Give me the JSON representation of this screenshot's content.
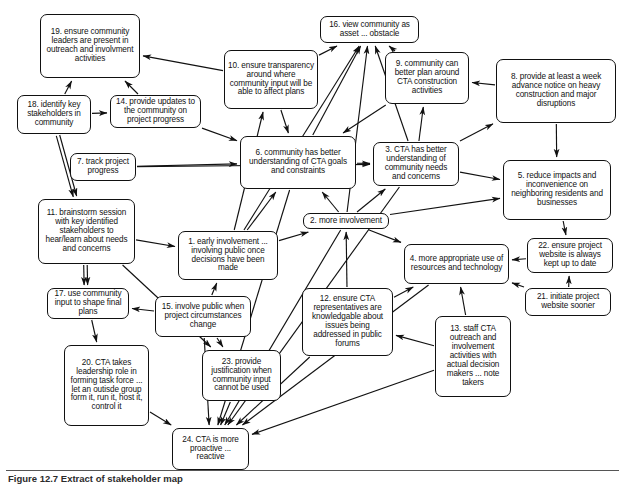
{
  "figure": {
    "caption": "Figure 12.7  Extract of stakeholder map",
    "type": "influence-diagram",
    "width": 625,
    "height": 483,
    "line_color": "#111111",
    "background_color": "#ffffff"
  },
  "nodes": [
    {
      "id": 19,
      "label": "19. ensure community leaders are present in outreach and involvment activities",
      "x": 40,
      "y": 14,
      "w": 100,
      "h": 64,
      "font": 8.2
    },
    {
      "id": 16,
      "label": "16. view community as asset ... obstacle",
      "x": 320,
      "y": 16,
      "w": 99,
      "h": 27,
      "font": 8.2
    },
    {
      "id": 10,
      "label": "10. ensure transparency around where community input will be able to affect plans",
      "x": 224,
      "y": 50,
      "w": 94,
      "h": 59,
      "font": 8.2
    },
    {
      "id": 9,
      "label": "9. community can better plan around CTA construction activities",
      "x": 385,
      "y": 52,
      "w": 84,
      "h": 52,
      "font": 8.2
    },
    {
      "id": 8,
      "label": "8. provide at least a week advance notice on heavy construction and major disruptions",
      "x": 496,
      "y": 59,
      "w": 120,
      "h": 64,
      "font": 8.2
    },
    {
      "id": 18,
      "label": "18. identify key stakeholders in community",
      "x": 17,
      "y": 95,
      "w": 74,
      "h": 39,
      "font": 8.2
    },
    {
      "id": 14,
      "label": "14. provide updates to the community on project progress",
      "x": 110,
      "y": 95,
      "w": 91,
      "h": 33,
      "font": 8.2
    },
    {
      "id": 6,
      "label": "6. community has better understanding of CTA goals and constraints",
      "x": 240,
      "y": 136,
      "w": 116,
      "h": 53,
      "font": 8.2
    },
    {
      "id": 3,
      "label": "3. CTA has better understanding of community needs and concerns",
      "x": 373,
      "y": 142,
      "w": 86,
      "h": 44,
      "font": 8.2
    },
    {
      "id": 7,
      "label": "7. track project progress",
      "x": 70,
      "y": 153,
      "w": 66,
      "h": 28,
      "font": 8.2
    },
    {
      "id": 5,
      "label": "5. reduce impacts and inconvenience on neighboring residents and businesses",
      "x": 503,
      "y": 160,
      "w": 108,
      "h": 60,
      "font": 8.2
    },
    {
      "id": 11,
      "label": "11. brainstorm session with key identified stakeholders to hear/learn about needs and concerns",
      "x": 38,
      "y": 199,
      "w": 97,
      "h": 65,
      "font": 8.2
    },
    {
      "id": 2,
      "label": "2. more involvement",
      "x": 303,
      "y": 213,
      "w": 86,
      "h": 16,
      "font": 8.2
    },
    {
      "id": 1,
      "label": "1. early involvement ... involving public once decisions have been made",
      "x": 178,
      "y": 231,
      "w": 100,
      "h": 49,
      "font": 8.2
    },
    {
      "id": 22,
      "label": "22. ensure project website is always kept up to date",
      "x": 527,
      "y": 238,
      "w": 86,
      "h": 35,
      "font": 8.2
    },
    {
      "id": 4,
      "label": "4. more appropriate use of resources and technology",
      "x": 404,
      "y": 244,
      "w": 105,
      "h": 40,
      "font": 8.2
    },
    {
      "id": 21,
      "label": "21. initiate project website sooner",
      "x": 525,
      "y": 288,
      "w": 86,
      "h": 28,
      "font": 8.2
    },
    {
      "id": 17,
      "label": "17. use community input to shape final plans",
      "x": 47,
      "y": 288,
      "w": 82,
      "h": 31,
      "font": 8.2
    },
    {
      "id": 12,
      "label": "12. ensure CTA representatives are knowledgable about issues being addressed in public forums",
      "x": 302,
      "y": 288,
      "w": 91,
      "h": 68,
      "font": 8.2
    },
    {
      "id": 15,
      "label": "15. involve public when project circumstances change",
      "x": 155,
      "y": 296,
      "w": 96,
      "h": 41,
      "font": 8.2
    },
    {
      "id": 13,
      "label": "13. staff CTA outreach and involvement activities with actual decision makers ... note takers",
      "x": 435,
      "y": 316,
      "w": 76,
      "h": 81,
      "font": 8.2
    },
    {
      "id": 20,
      "label": "20. CTA takes leadership role in forming task force ... let an outisde group form it, run it, host it, control it",
      "x": 64,
      "y": 345,
      "w": 85,
      "h": 81,
      "font": 8.2
    },
    {
      "id": 23,
      "label": "23. provide justification when community input cannot be used",
      "x": 202,
      "y": 350,
      "w": 79,
      "h": 51,
      "font": 8.2
    },
    {
      "id": 24,
      "label": "24. CTA is more proactive ... reactive",
      "x": 172,
      "y": 428,
      "w": 77,
      "h": 42,
      "font": 8.2
    }
  ],
  "edges": [
    {
      "from": 18,
      "to": 19
    },
    {
      "from": 18,
      "to": 11
    },
    {
      "from": 18,
      "to": 11,
      "dup": true
    },
    {
      "from": 14,
      "to": 19
    },
    {
      "from": 14,
      "to": 18,
      "reverse": true
    },
    {
      "from": 10,
      "to": 19
    },
    {
      "from": 10,
      "to": 16
    },
    {
      "from": 10,
      "to": 6
    },
    {
      "from": 9,
      "to": 16
    },
    {
      "from": 9,
      "to": 6
    },
    {
      "from": 8,
      "to": 9
    },
    {
      "from": 8,
      "to": 5
    },
    {
      "from": 8,
      "to": 3,
      "reverse": true
    },
    {
      "from": 6,
      "to": 16
    },
    {
      "from": 6,
      "to": 3
    },
    {
      "from": 3,
      "to": 16
    },
    {
      "from": 3,
      "to": 9
    },
    {
      "from": 3,
      "to": 5
    },
    {
      "from": 3,
      "to": 24
    },
    {
      "from": 7,
      "to": 6
    },
    {
      "from": 11,
      "to": 17
    },
    {
      "from": 11,
      "to": 17,
      "dup": true
    },
    {
      "from": 11,
      "to": 1
    },
    {
      "from": 11,
      "to": 23
    },
    {
      "from": 1,
      "to": 6
    },
    {
      "from": 1,
      "to": 2
    },
    {
      "from": 1,
      "to": 10
    },
    {
      "from": 1,
      "to": 16
    },
    {
      "from": 2,
      "to": 6
    },
    {
      "from": 2,
      "to": 3
    },
    {
      "from": 2,
      "to": 4
    },
    {
      "from": 2,
      "to": 5
    },
    {
      "from": 2,
      "to": 16
    },
    {
      "from": 2,
      "to": 24
    },
    {
      "from": 15,
      "to": 1
    },
    {
      "from": 15,
      "to": 23
    },
    {
      "from": 15,
      "to": 24
    },
    {
      "from": 17,
      "to": 20
    },
    {
      "from": 17,
      "to": 15,
      "reverse": true
    },
    {
      "from": 20,
      "to": 24
    },
    {
      "from": 23,
      "to": 24
    },
    {
      "from": 12,
      "to": 4
    },
    {
      "from": 12,
      "to": 2
    },
    {
      "from": 13,
      "to": 4
    },
    {
      "from": 13,
      "to": 12
    },
    {
      "from": 13,
      "to": 24
    },
    {
      "from": 22,
      "to": 4
    },
    {
      "from": 21,
      "to": 22
    },
    {
      "from": 21,
      "to": 4
    },
    {
      "from": 5,
      "to": 22
    },
    {
      "from": 12,
      "to": 24
    },
    {
      "from": 4,
      "to": 24
    },
    {
      "from": 6,
      "to": 24
    },
    {
      "from": 14,
      "to": 6
    },
    {
      "from": 7,
      "to": 3
    }
  ]
}
